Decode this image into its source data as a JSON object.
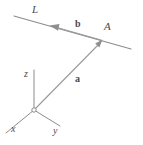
{
  "figure": {
    "caption": "",
    "background_color": "#ffffff",
    "line_color": "#8c8c8c",
    "label_color": "#4a4a4a",
    "labels": {
      "line_L": "L",
      "point_A": "A",
      "vector_b": "b",
      "vector_a": "a",
      "axis_x": "x",
      "axis_y": "y",
      "axis_z": "z"
    },
    "elements": [
      {
        "name": "line-L",
        "type": "line",
        "description": "straight line L through point A, extending from upper-left to lower-right",
        "from": [
          14,
          16
        ],
        "to": [
          131,
          49
        ]
      },
      {
        "name": "vector-b",
        "type": "arrow",
        "description": "vector b along line L from point A toward the upper-left direction of L",
        "from": [
          101,
          40
        ],
        "to": [
          51,
          26
        ]
      },
      {
        "name": "vector-a",
        "type": "arrow",
        "description": "position vector a from the origin to point A",
        "from": [
          34,
          110
        ],
        "to": [
          102,
          41
        ]
      },
      {
        "name": "axis-z",
        "type": "line",
        "description": "vertical z axis from origin upward",
        "from": [
          34,
          110
        ],
        "to": [
          34,
          70
        ]
      },
      {
        "name": "axis-x",
        "type": "line",
        "description": "x axis from origin toward lower-left",
        "from": [
          34,
          110
        ],
        "to": [
          6,
          133
        ]
      },
      {
        "name": "axis-y",
        "type": "line",
        "description": "y axis from origin toward lower-right",
        "from": [
          34,
          110
        ],
        "to": [
          60,
          126
        ]
      },
      {
        "name": "origin-point",
        "type": "circle",
        "description": "small open circle marking the coordinate origin",
        "center": [
          34,
          110
        ],
        "radius": 2.2
      },
      {
        "name": "point-A-marker",
        "type": "point",
        "description": "point A located on line L",
        "center": [
          102,
          41
        ]
      }
    ]
  }
}
